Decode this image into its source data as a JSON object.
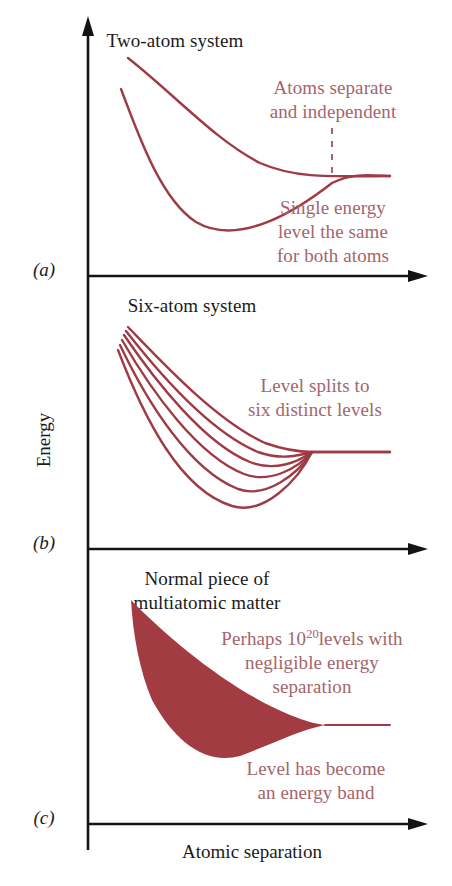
{
  "figure": {
    "kind": "energy-band-formation-diagram",
    "background": "#ffffff",
    "curve_color": "#9e3b45",
    "band_fill_color": "#a33b42",
    "annotation_color": "#a4656b",
    "axis_color": "#141414",
    "axis_y_label": "Energy",
    "axis_x_label": "Atomic separation"
  },
  "panels": [
    {
      "key": "a",
      "label": "(a)",
      "title": "Two-atom system",
      "annotations": [
        {
          "key": "separate",
          "lines": [
            "Atoms separate",
            "and independent"
          ]
        },
        {
          "key": "single-level",
          "lines": [
            "Single energy",
            "level the same",
            "for both atoms"
          ]
        }
      ]
    },
    {
      "key": "b",
      "label": "(b)",
      "title": "Six-atom system",
      "annotations": [
        {
          "key": "level-splits",
          "lines": [
            "Level splits to",
            "six distinct levels"
          ]
        }
      ]
    },
    {
      "key": "c",
      "label": "(c)",
      "title_lines": [
        "Normal piece of",
        "multiatomic matter"
      ],
      "annotations": [
        {
          "key": "many-levels",
          "lines": [
            "Perhaps 10",
            "levels with",
            "negligible energy",
            "separation"
          ],
          "exponent": "20"
        },
        {
          "key": "energy-band",
          "lines": [
            "Level has become",
            "an energy band"
          ]
        }
      ]
    }
  ],
  "chart_data": {
    "type": "line",
    "xlabel": "Atomic separation",
    "ylabel": "Energy",
    "grid": false,
    "legend": false,
    "axis_note": "Axes are qualitative; no numeric tick labels are shown.",
    "panels": [
      {
        "id": "a",
        "title": "Two-atom system",
        "series": [
          {
            "name": "upper-level",
            "note": "Monotonically decreasing curve approaching the common asymptote from above",
            "path": "M 128,58 C 175,95 215,140 260,163 C 292,177 320,177 390,176"
          },
          {
            "name": "lower-level",
            "note": "Curve with a potential-well minimum that rises back to the common asymptote",
            "path": "M 121,89 C 140,140 162,200 196,222 C 240,248 300,208 332,183 C 352,173 368,175 390,176"
          }
        ],
        "asymptote_y": 176,
        "marker": {
          "name": "separation-dashed-line",
          "x": 332,
          "y_top": 120,
          "y_bottom": 176
        }
      },
      {
        "id": "b",
        "title": "Six-atom system",
        "note": "Single level splits into six distinct levels that converge at large separation",
        "convergence": {
          "x": 312,
          "y": 452
        },
        "series": [
          {
            "name": "level-1",
            "path": "M 128,327 C 160,360 215,420 265,443 C 285,450 298,452 312,452 C 340,452 365,452 390,452"
          },
          {
            "name": "level-2",
            "path": "M 126,331 C 158,372 210,432 258,452 C 280,460 298,456 312,452 C 340,452 365,452 390,452"
          },
          {
            "name": "level-3",
            "path": "M 124,335 C 156,382 205,444 250,462 C 275,472 298,462 312,452"
          },
          {
            "name": "level-4",
            "path": "M 122,340 C 152,392 198,456 244,474 C 270,484 298,468 312,452"
          },
          {
            "name": "level-5",
            "path": "M 120,345 C 148,404 190,470 238,489 C 266,499 298,474 312,452"
          },
          {
            "name": "level-6",
            "path": "M 118,350 C 144,418 180,490 232,506 C 264,516 298,480 312,452"
          }
        ],
        "asymptote_y": 452
      },
      {
        "id": "c",
        "title": "Normal piece of multiatomic matter",
        "note": "Continuum of ~10^20 levels drawn as a solid filled band tapering to a single line",
        "band": {
          "name": "energy-band-region",
          "path": "M 131,600 C 170,640 230,690 290,715 C 305,721 316,724 325,725 C 300,730 270,745 240,756 C 205,765 175,742 152,700 C 140,672 133,636 131,600 Z"
        },
        "tail": {
          "name": "band-tail-line",
          "path": "M 325,725 L 390,725"
        },
        "asymptote_y": 725
      }
    ]
  }
}
